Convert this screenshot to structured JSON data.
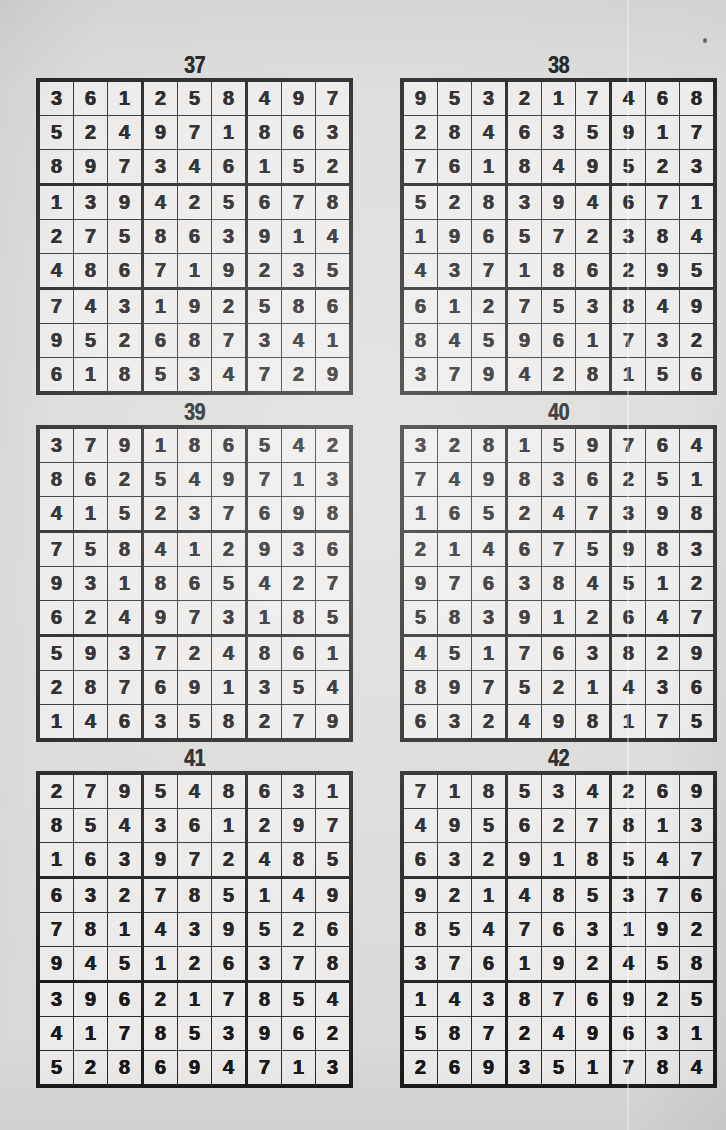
{
  "page": {
    "background_color": "#d9d9d7",
    "cell_background_color": "#eceae8",
    "ink_color": "#171717",
    "grid_line_color": "#1b1b1b"
  },
  "puzzles": [
    {
      "title": "37",
      "rows": [
        [
          "3",
          "6",
          "1",
          "2",
          "5",
          "8",
          "4",
          "9",
          "7"
        ],
        [
          "5",
          "2",
          "4",
          "9",
          "7",
          "1",
          "8",
          "6",
          "3"
        ],
        [
          "8",
          "9",
          "7",
          "3",
          "4",
          "6",
          "1",
          "5",
          "2"
        ],
        [
          "1",
          "3",
          "9",
          "4",
          "2",
          "5",
          "6",
          "7",
          "8"
        ],
        [
          "2",
          "7",
          "5",
          "8",
          "6",
          "3",
          "9",
          "1",
          "4"
        ],
        [
          "4",
          "8",
          "6",
          "7",
          "1",
          "9",
          "2",
          "3",
          "5"
        ],
        [
          "7",
          "4",
          "3",
          "1",
          "9",
          "2",
          "5",
          "8",
          "6"
        ],
        [
          "9",
          "5",
          "2",
          "6",
          "8",
          "7",
          "3",
          "4",
          "1"
        ],
        [
          "6",
          "1",
          "8",
          "5",
          "3",
          "4",
          "7",
          "2",
          "9"
        ]
      ]
    },
    {
      "title": "38",
      "rows": [
        [
          "9",
          "5",
          "3",
          "2",
          "1",
          "7",
          "4",
          "6",
          "8"
        ],
        [
          "2",
          "8",
          "4",
          "6",
          "3",
          "5",
          "9",
          "1",
          "7"
        ],
        [
          "7",
          "6",
          "1",
          "8",
          "4",
          "9",
          "5",
          "2",
          "3"
        ],
        [
          "5",
          "2",
          "8",
          "3",
          "9",
          "4",
          "6",
          "7",
          "1"
        ],
        [
          "1",
          "9",
          "6",
          "5",
          "7",
          "2",
          "3",
          "8",
          "4"
        ],
        [
          "4",
          "3",
          "7",
          "1",
          "8",
          "6",
          "2",
          "9",
          "5"
        ],
        [
          "6",
          "1",
          "2",
          "7",
          "5",
          "3",
          "8",
          "4",
          "9"
        ],
        [
          "8",
          "4",
          "5",
          "9",
          "6",
          "1",
          "7",
          "3",
          "2"
        ],
        [
          "3",
          "7",
          "9",
          "4",
          "2",
          "8",
          "1",
          "5",
          "6"
        ]
      ]
    },
    {
      "title": "39",
      "rows": [
        [
          "3",
          "7",
          "9",
          "1",
          "8",
          "6",
          "5",
          "4",
          "2"
        ],
        [
          "8",
          "6",
          "2",
          "5",
          "4",
          "9",
          "7",
          "1",
          "3"
        ],
        [
          "4",
          "1",
          "5",
          "2",
          "3",
          "7",
          "6",
          "9",
          "8"
        ],
        [
          "7",
          "5",
          "8",
          "4",
          "1",
          "2",
          "9",
          "3",
          "6"
        ],
        [
          "9",
          "3",
          "1",
          "8",
          "6",
          "5",
          "4",
          "2",
          "7"
        ],
        [
          "6",
          "2",
          "4",
          "9",
          "7",
          "3",
          "1",
          "8",
          "5"
        ],
        [
          "5",
          "9",
          "3",
          "7",
          "2",
          "4",
          "8",
          "6",
          "1"
        ],
        [
          "2",
          "8",
          "7",
          "6",
          "9",
          "1",
          "3",
          "5",
          "4"
        ],
        [
          "1",
          "4",
          "6",
          "3",
          "5",
          "8",
          "2",
          "7",
          "9"
        ]
      ]
    },
    {
      "title": "40",
      "rows": [
        [
          "3",
          "2",
          "8",
          "1",
          "5",
          "9",
          "7",
          "6",
          "4"
        ],
        [
          "7",
          "4",
          "9",
          "8",
          "3",
          "6",
          "2",
          "5",
          "1"
        ],
        [
          "1",
          "6",
          "5",
          "2",
          "4",
          "7",
          "3",
          "9",
          "8"
        ],
        [
          "2",
          "1",
          "4",
          "6",
          "7",
          "5",
          "9",
          "8",
          "3"
        ],
        [
          "9",
          "7",
          "6",
          "3",
          "8",
          "4",
          "5",
          "1",
          "2"
        ],
        [
          "5",
          "8",
          "3",
          "9",
          "1",
          "2",
          "6",
          "4",
          "7"
        ],
        [
          "4",
          "5",
          "1",
          "7",
          "6",
          "3",
          "8",
          "2",
          "9"
        ],
        [
          "8",
          "9",
          "7",
          "5",
          "2",
          "1",
          "4",
          "3",
          "6"
        ],
        [
          "6",
          "3",
          "2",
          "4",
          "9",
          "8",
          "1",
          "7",
          "5"
        ]
      ]
    },
    {
      "title": "41",
      "rows": [
        [
          "2",
          "7",
          "9",
          "5",
          "4",
          "8",
          "6",
          "3",
          "1"
        ],
        [
          "8",
          "5",
          "4",
          "3",
          "6",
          "1",
          "2",
          "9",
          "7"
        ],
        [
          "1",
          "6",
          "3",
          "9",
          "7",
          "2",
          "4",
          "8",
          "5"
        ],
        [
          "6",
          "3",
          "2",
          "7",
          "8",
          "5",
          "1",
          "4",
          "9"
        ],
        [
          "7",
          "8",
          "1",
          "4",
          "3",
          "9",
          "5",
          "2",
          "6"
        ],
        [
          "9",
          "4",
          "5",
          "1",
          "2",
          "6",
          "3",
          "7",
          "8"
        ],
        [
          "3",
          "9",
          "6",
          "2",
          "1",
          "7",
          "8",
          "5",
          "4"
        ],
        [
          "4",
          "1",
          "7",
          "8",
          "5",
          "3",
          "9",
          "6",
          "2"
        ],
        [
          "5",
          "2",
          "8",
          "6",
          "9",
          "4",
          "7",
          "1",
          "3"
        ]
      ]
    },
    {
      "title": "42",
      "rows": [
        [
          "7",
          "1",
          "8",
          "5",
          "3",
          "4",
          "2",
          "6",
          "9"
        ],
        [
          "4",
          "9",
          "5",
          "6",
          "2",
          "7",
          "8",
          "1",
          "3"
        ],
        [
          "6",
          "3",
          "2",
          "9",
          "1",
          "8",
          "5",
          "4",
          "7"
        ],
        [
          "9",
          "2",
          "1",
          "4",
          "8",
          "5",
          "3",
          "7",
          "6"
        ],
        [
          "8",
          "5",
          "4",
          "7",
          "6",
          "3",
          "1",
          "9",
          "2"
        ],
        [
          "3",
          "7",
          "6",
          "1",
          "9",
          "2",
          "4",
          "5",
          "8"
        ],
        [
          "1",
          "4",
          "3",
          "8",
          "7",
          "6",
          "9",
          "2",
          "5"
        ],
        [
          "5",
          "8",
          "7",
          "2",
          "4",
          "9",
          "6",
          "3",
          "1"
        ],
        [
          "2",
          "6",
          "9",
          "3",
          "5",
          "1",
          "7",
          "8",
          "4"
        ]
      ]
    }
  ]
}
